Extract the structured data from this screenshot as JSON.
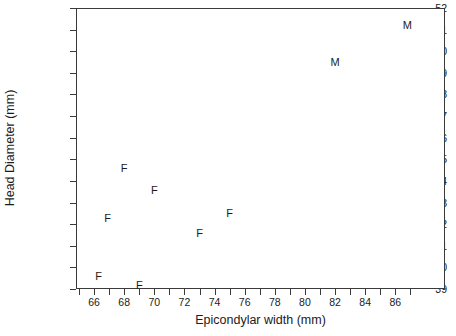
{
  "chart_data": {
    "type": "scatter",
    "title": "",
    "xlabel": "Epicondylar width (mm)",
    "ylabel": "Head Diameter (mm)",
    "xlim": [
      64.8,
      89.3
    ],
    "ylim": [
      39,
      52
    ],
    "xticks": [
      66,
      68,
      70,
      72,
      74,
      76,
      78,
      80,
      82,
      84,
      86
    ],
    "yticks": [
      39,
      40,
      41,
      42,
      43,
      44,
      45,
      46,
      47,
      48,
      49,
      50,
      51,
      52
    ],
    "minor_xticks": [
      65,
      67,
      69,
      71,
      73,
      75,
      77,
      79,
      81,
      83,
      85,
      87
    ],
    "grid": false,
    "legend": null,
    "marker_style": "text-label",
    "series": [
      {
        "name": "F",
        "marker": "F",
        "points": [
          {
            "x": 66.3,
            "y": 39.6,
            "label": "F"
          },
          {
            "x": 69.0,
            "y": 39.2,
            "label": "F"
          },
          {
            "x": 66.9,
            "y": 42.3,
            "label": "F"
          },
          {
            "x": 68.0,
            "y": 44.6,
            "label": "F"
          },
          {
            "x": 70.0,
            "y": 43.6,
            "label": "F"
          },
          {
            "x": 73.0,
            "y": 41.6,
            "label": "F"
          },
          {
            "x": 75.0,
            "y": 42.5,
            "label": "F"
          }
        ]
      },
      {
        "name": "M",
        "marker": "M",
        "points": [
          {
            "x": 82.0,
            "y": 49.5,
            "label": "M"
          },
          {
            "x": 86.8,
            "y": 51.2,
            "label": "M"
          }
        ]
      }
    ]
  },
  "axes": {
    "x_title": "Epicondylar width (mm)",
    "y_title": "Head Diameter (mm)",
    "x_tick_labels": [
      "66",
      "68",
      "70",
      "72",
      "74",
      "76",
      "78",
      "80",
      "82",
      "84",
      "86"
    ],
    "y_tick_labels": [
      "39",
      "40",
      "41",
      "42",
      "43",
      "44",
      "45",
      "46",
      "47",
      "48",
      "49",
      "50",
      "51",
      "52"
    ]
  },
  "colors": {
    "axis": "#3a3a3a",
    "text": "#1b1b1b",
    "background": "#ffffff"
  }
}
